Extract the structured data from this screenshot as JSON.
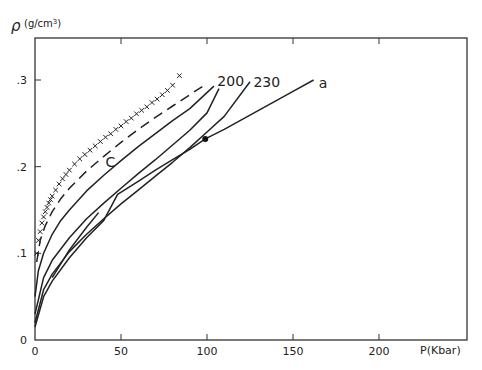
{
  "chart_data": {
    "type": "line",
    "title": "",
    "xlabel": "P(Kbar)",
    "ylabel": "ρ (g/cm³)",
    "ylabel_symbol": "ρ",
    "ylabel_unit": "(g/cm",
    "ylabel_unit_sup": "3",
    "ylabel_unit_close": ")",
    "xlim": [
      0,
      250
    ],
    "ylim": [
      0,
      0.35
    ],
    "grid": false,
    "x_ticks": [
      {
        "value": 0,
        "label": "0"
      },
      {
        "value": 50,
        "label": "50"
      },
      {
        "value": 100,
        "label": "100"
      },
      {
        "value": 150,
        "label": "150"
      },
      {
        "value": 200,
        "label": "200"
      }
    ],
    "y_ticks": [
      {
        "value": 0,
        "label": "0"
      },
      {
        "value": 0.1,
        "label": ".1"
      },
      {
        "value": 0.2,
        "label": ".2"
      },
      {
        "value": 0.3,
        "label": ".3"
      }
    ],
    "series": [
      {
        "name": "crosses (experimental)",
        "style": "x-markers",
        "x": [
          1,
          2,
          3,
          4,
          5,
          6,
          7,
          8,
          9,
          10,
          12,
          14,
          16,
          18,
          20,
          23,
          26,
          29,
          32,
          35,
          38,
          41,
          44,
          47,
          50,
          53,
          56,
          59,
          62,
          65,
          68,
          71,
          74,
          77,
          80,
          84
        ],
        "y": [
          0.1,
          0.115,
          0.125,
          0.135,
          0.142,
          0.148,
          0.153,
          0.158,
          0.162,
          0.166,
          0.173,
          0.18,
          0.186,
          0.191,
          0.196,
          0.203,
          0.209,
          0.214,
          0.219,
          0.224,
          0.229,
          0.234,
          0.238,
          0.243,
          0.247,
          0.252,
          0.256,
          0.261,
          0.265,
          0.269,
          0.274,
          0.278,
          0.283,
          0.288,
          0.294,
          0.305
        ]
      },
      {
        "name": "dashed",
        "style": "dashed",
        "x": [
          1,
          3,
          6,
          10,
          15,
          20,
          30,
          40,
          50,
          60,
          70,
          80,
          90,
          100
        ],
        "y": [
          0.09,
          0.115,
          0.132,
          0.148,
          0.163,
          0.175,
          0.195,
          0.212,
          0.228,
          0.243,
          0.257,
          0.27,
          0.283,
          0.296
        ]
      },
      {
        "name": "C",
        "style": "solid",
        "label": "C",
        "x": [
          0,
          2,
          5,
          10,
          15,
          20,
          30,
          40,
          50,
          60,
          70,
          80,
          90,
          104
        ],
        "y": [
          0.05,
          0.08,
          0.1,
          0.122,
          0.138,
          0.15,
          0.172,
          0.19,
          0.207,
          0.223,
          0.238,
          0.253,
          0.267,
          0.293
        ]
      },
      {
        "name": "200",
        "style": "solid",
        "label": "200",
        "x": [
          0,
          5,
          10,
          20,
          30,
          40,
          50,
          60,
          70,
          80,
          90,
          100,
          107
        ],
        "y": [
          0.03,
          0.072,
          0.092,
          0.118,
          0.14,
          0.158,
          0.175,
          0.192,
          0.208,
          0.225,
          0.242,
          0.262,
          0.29
        ]
      },
      {
        "name": "230",
        "style": "solid",
        "label": "230",
        "x": [
          0,
          5,
          10,
          20,
          30,
          40,
          50,
          60,
          70,
          80,
          90,
          100,
          110,
          125
        ],
        "y": [
          0.02,
          0.058,
          0.076,
          0.102,
          0.122,
          0.14,
          0.157,
          0.173,
          0.189,
          0.205,
          0.222,
          0.24,
          0.258,
          0.298
        ]
      },
      {
        "name": "a",
        "style": "solid",
        "label": "a",
        "x": [
          0,
          5,
          10,
          20,
          30,
          40,
          48,
          60,
          70,
          80,
          90,
          99,
          110,
          120,
          130,
          140,
          150,
          162
        ],
        "y": [
          0.015,
          0.05,
          0.068,
          0.095,
          0.118,
          0.138,
          0.168,
          0.183,
          0.196,
          0.208,
          0.22,
          0.232,
          0.243,
          0.254,
          0.265,
          0.276,
          0.287,
          0.3
        ]
      },
      {
        "name": "a-branch",
        "style": "solid",
        "x": [
          10,
          20,
          30,
          37
        ],
        "y": [
          0.072,
          0.104,
          0.13,
          0.147
        ]
      }
    ],
    "markers": [
      {
        "series": "a",
        "x": 99,
        "y": 0.232,
        "shape": "filled-circle"
      }
    ],
    "annotations": [
      {
        "text": "C",
        "x": 41,
        "y": 0.2
      },
      {
        "text": "200",
        "x": 106,
        "y": 0.293
      },
      {
        "text": "230",
        "x": 127,
        "y": 0.292
      },
      {
        "text": "a",
        "x": 165,
        "y": 0.291
      }
    ]
  }
}
